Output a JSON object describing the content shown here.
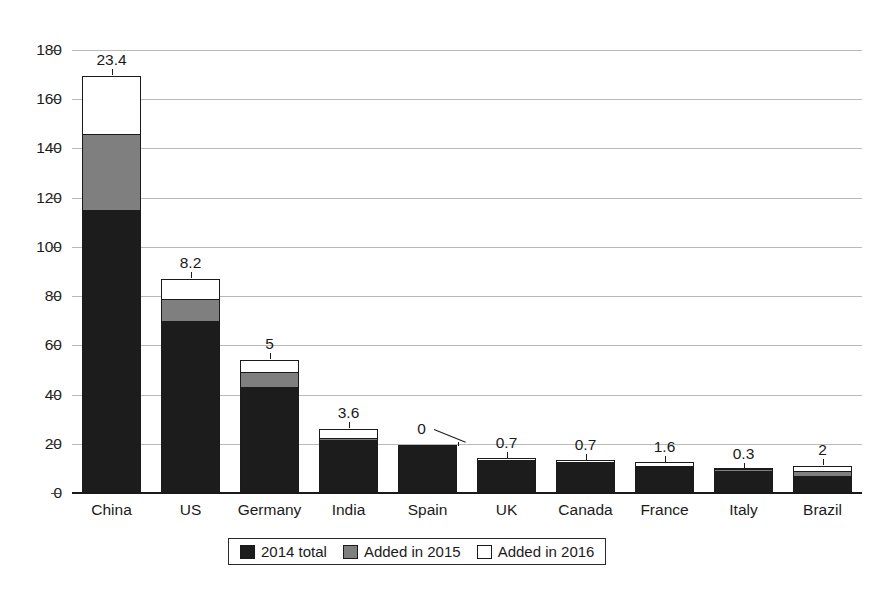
{
  "chart_data": {
    "type": "bar",
    "subtype": "stacked-bar",
    "title": "",
    "subtitle": "",
    "xlabel": "",
    "ylabel": "",
    "ylim": [
      0,
      180
    ],
    "ytick_step": 20,
    "ytick_labels": [
      "0",
      "20",
      "40",
      "60",
      "80",
      "100",
      "120",
      "140",
      "160",
      "180"
    ],
    "grid": true,
    "grid_axis": "y",
    "legend_position": "bottom-center",
    "categories": [
      "China",
      "US",
      "Germany",
      "India",
      "Spain",
      "UK",
      "Canada",
      "France",
      "Italy",
      "Brazil"
    ],
    "series": [
      {
        "name": "2014 total",
        "color": "#1c1c1c",
        "values": [
          115,
          70,
          43,
          21.5,
          19.5,
          13,
          12,
          10.4,
          9,
          7
        ]
      },
      {
        "name": "Added in 2015",
        "color": "#7f7f7f",
        "values": [
          31,
          8.8,
          6,
          1,
          0,
          0.3,
          0.4,
          0.1,
          0.2,
          2
        ]
      },
      {
        "name": "Added in 2016",
        "color": "#ffffff",
        "values": [
          23.4,
          8.2,
          5,
          3.6,
          0,
          0.7,
          0.7,
          1.6,
          0.3,
          2
        ]
      }
    ],
    "data_labels": {
      "series": "Added in 2016",
      "values": [
        "23.4",
        "8.2",
        "5",
        "3.6",
        "0",
        "0.7",
        "0.7",
        "1.6",
        "0.3",
        "2"
      ]
    },
    "totals": [
      169.4,
      87,
      54,
      26.1,
      19.5,
      14,
      13.1,
      12.1,
      9.5,
      11
    ]
  },
  "legend": {
    "items": [
      {
        "label": "2014 total",
        "swatch": "black"
      },
      {
        "label": "Added in 2015",
        "swatch": "gray"
      },
      {
        "label": "Added in 2016",
        "swatch": "white"
      }
    ]
  }
}
